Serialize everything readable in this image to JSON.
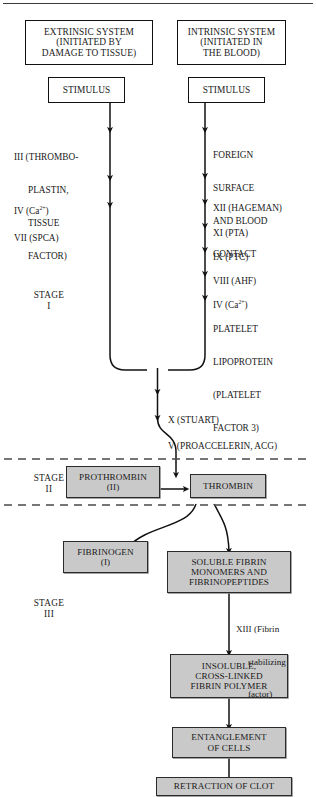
{
  "figure": {
    "colors": {
      "box_fill_gray": "#c9c9c9",
      "box_fill_white": "#ffffff",
      "stroke": "#111111",
      "text": "#1a1a1a"
    }
  },
  "stages": [
    {
      "id": "stage-1",
      "name": "STAGE",
      "numeral": "I"
    },
    {
      "id": "stage-2",
      "name": "STAGE",
      "numeral": "II"
    },
    {
      "id": "stage-3",
      "name": "STAGE",
      "numeral": "III"
    }
  ],
  "headers": {
    "extrinsic": [
      "EXTRINSIC SYSTEM",
      "(INITIATED BY",
      "DAMAGE TO TISSUE)"
    ],
    "intrinsic": [
      "INTRINSIC SYSTEM",
      "(INITIATED IN",
      "THE BLOOD)"
    ]
  },
  "stimulus": {
    "extrinsic_label": "STIMULUS",
    "intrinsic_label": "STIMULUS"
  },
  "extrinsic_factors": [
    {
      "id": "factor-iii",
      "lines": [
        "III (THROMBO-",
        "PLASTIN,",
        "TISSUE",
        "FACTOR)"
      ]
    },
    {
      "id": "factor-iv-extrinsic",
      "lines": [
        "IV (Ca2+)"
      ],
      "html": "IV (Ca<sup>2+</sup>)"
    },
    {
      "id": "factor-vii",
      "lines": [
        "VII (SPCA)"
      ]
    }
  ],
  "intrinsic_factors": [
    {
      "id": "foreign-surface",
      "lines": [
        "FOREIGN",
        "SURFACE",
        "AND BLOOD",
        "CONTACT"
      ]
    },
    {
      "id": "factor-xii",
      "lines": [
        "XII (HAGEMAN)"
      ]
    },
    {
      "id": "factor-xi",
      "lines": [
        "XI (PTA)"
      ]
    },
    {
      "id": "factor-ix",
      "lines": [
        "IX (PTC)"
      ]
    },
    {
      "id": "factor-viii",
      "lines": [
        "VIII (AHF)"
      ]
    },
    {
      "id": "factor-iv-intrinsic",
      "lines": [
        "IV (Ca2+)"
      ],
      "html": "IV (Ca<sup>2+</sup>)"
    },
    {
      "id": "platelet-lipoprotein",
      "lines": [
        "PLATELET",
        "LIPOPROTEIN",
        "(PLATELET",
        "FACTOR 3)"
      ]
    }
  ],
  "common_pathway": [
    {
      "id": "factor-x",
      "label": "X (STUART)"
    },
    {
      "id": "factor-v",
      "label": "V (PROACCELERIN, ACG)"
    }
  ],
  "nodes": {
    "prothrombin": [
      "PROTHROMBIN",
      "(II)"
    ],
    "thrombin": [
      "THROMBIN"
    ],
    "fibrinogen": [
      "FIBRINOGEN",
      "(I)"
    ],
    "soluble_fibrin": [
      "SOLUBLE FIBRIN",
      "MONOMERS AND",
      "FIBRINOPEPTIDES"
    ],
    "insoluble_fibrin": [
      "INSOLUBLE,",
      "CROSS-LINKED",
      "FIBRIN POLYMER"
    ],
    "entanglement": [
      "ENTANGLEMENT",
      "OF CELLS"
    ],
    "retraction": [
      "RETRACTION OF CLOT"
    ]
  },
  "annotations": {
    "factor_xiii": [
      "XIII (Fibrin",
      "stabilizing",
      "factor)"
    ]
  }
}
